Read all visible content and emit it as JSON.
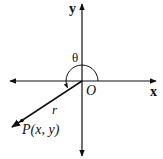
{
  "diagram": {
    "labels": {
      "y_axis": "y",
      "x_axis": "x",
      "origin": "O",
      "theta": "θ",
      "radius": "r",
      "point": "P(x, y)"
    },
    "colors": {
      "stroke": "#111111",
      "background": "#ffffff"
    }
  }
}
